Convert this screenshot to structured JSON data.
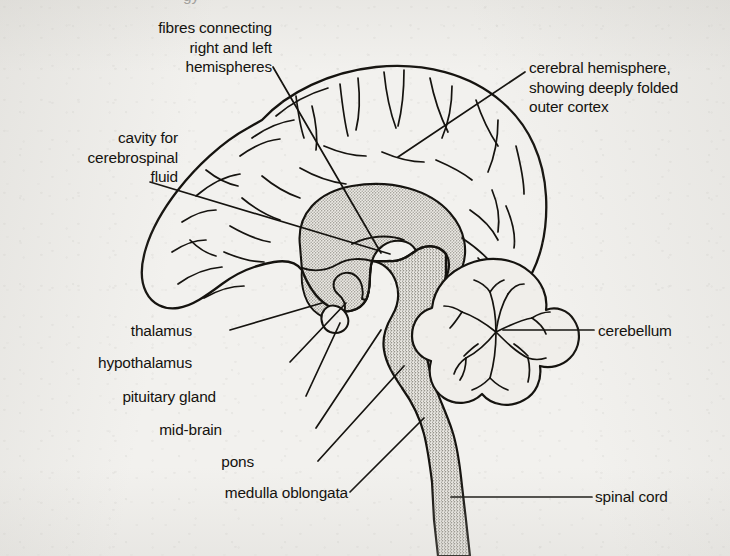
{
  "figure": {
    "ink_color": "#15130f",
    "paper_color": "#f2f1ee",
    "stipple_color": "#b9b7b0"
  },
  "clipped_line": "gy",
  "labels": [
    {
      "id": "fibres-connecting",
      "name": "label-fibres-connecting-hemispheres",
      "text": "fibres connecting\nright and left\nhemispheres",
      "align": "right",
      "x": 22,
      "y": 18,
      "width": 250
    },
    {
      "id": "cerebral-hemisphere",
      "name": "label-cerebral-hemisphere",
      "text": "cerebral hemisphere,\nshowing deeply folded\nouter cortex",
      "align": "left",
      "x": 529,
      "y": 58,
      "width": 200
    },
    {
      "id": "cavity-csf",
      "name": "label-cavity-cerebrospinal-fluid",
      "text": "cavity for\ncerebrospinal\nfluid",
      "align": "right",
      "x": 6,
      "y": 128,
      "width": 172
    },
    {
      "id": "thalamus",
      "name": "label-thalamus",
      "text": "thalamus",
      "align": "right",
      "x": 60,
      "y": 321,
      "width": 132
    },
    {
      "id": "hypothalamus",
      "name": "label-hypothalamus",
      "text": "hypothalamus",
      "align": "right",
      "x": 40,
      "y": 353,
      "width": 152
    },
    {
      "id": "pituitary-gland",
      "name": "label-pituitary-gland",
      "text": "pituitary gland",
      "align": "right",
      "x": 48,
      "y": 387,
      "width": 168
    },
    {
      "id": "mid-brain",
      "name": "label-mid-brain",
      "text": "mid-brain",
      "align": "right",
      "x": 98,
      "y": 420,
      "width": 124
    },
    {
      "id": "pons",
      "name": "label-pons",
      "text": "pons",
      "align": "right",
      "x": 190,
      "y": 452,
      "width": 64
    },
    {
      "id": "medulla-oblongata",
      "name": "label-medulla-oblongata",
      "text": "medulla oblongata",
      "align": "right",
      "x": 140,
      "y": 483,
      "width": 208
    },
    {
      "id": "cerebellum",
      "name": "label-cerebellum",
      "text": "cerebellum",
      "align": "left",
      "x": 598,
      "y": 321,
      "width": 130
    },
    {
      "id": "spinal-cord",
      "name": "label-spinal-cord",
      "text": "spinal cord",
      "align": "left",
      "x": 595,
      "y": 487,
      "width": 130
    }
  ],
  "leader_lines": [
    {
      "name": "leader-fibres-connecting",
      "from": [
        273,
        67
      ],
      "to": [
        381,
        253
      ]
    },
    {
      "name": "leader-cerebral-hemisphere",
      "from": [
        525,
        72
      ],
      "to": [
        398,
        157
      ]
    },
    {
      "name": "leader-cavity-csf",
      "from": [
        150,
        182
      ],
      "to": [
        390,
        254
      ]
    },
    {
      "name": "leader-thalamus",
      "from": [
        230,
        330
      ],
      "to": [
        322,
        303
      ]
    },
    {
      "name": "leader-hypothalamus",
      "from": [
        290,
        362
      ],
      "to": [
        346,
        303
      ]
    },
    {
      "name": "leader-pituitary-gland",
      "from": [
        306,
        396
      ],
      "to": [
        340,
        323
      ]
    },
    {
      "name": "leader-mid-brain",
      "from": [
        316,
        428
      ],
      "to": [
        381,
        330
      ]
    },
    {
      "name": "leader-pons",
      "from": [
        318,
        461
      ],
      "to": [
        404,
        366
      ]
    },
    {
      "name": "leader-medulla-oblongata",
      "from": [
        350,
        492
      ],
      "to": [
        424,
        418
      ]
    },
    {
      "name": "leader-cerebellum",
      "from": [
        594,
        330
      ],
      "to": [
        503,
        330
      ]
    },
    {
      "name": "leader-spinal-cord",
      "from": [
        592,
        497
      ],
      "to": [
        451,
        497
      ]
    }
  ],
  "anatomy_regions": [
    {
      "name": "cerebral-cortex-outline",
      "shaded": false
    },
    {
      "name": "corpus-callosum",
      "shaded": true
    },
    {
      "name": "lateral-ventricle-cavity",
      "shaded": false
    },
    {
      "name": "thalamus-region",
      "shaded": true
    },
    {
      "name": "pituitary-gland-lobe",
      "shaded": false
    },
    {
      "name": "brainstem",
      "shaded": true
    },
    {
      "name": "cerebellum-arbor-vitae",
      "shaded": false
    },
    {
      "name": "spinal-cord-column",
      "shaded": true
    }
  ]
}
